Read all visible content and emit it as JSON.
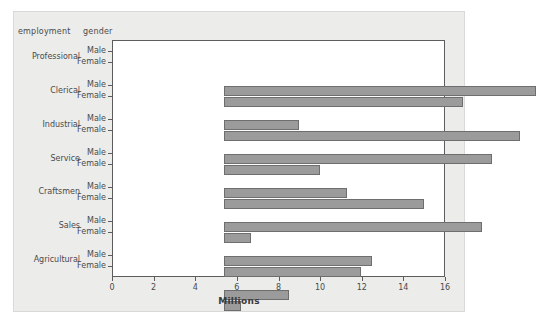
{
  "headers": {
    "employment": "employment",
    "gender": "gender"
  },
  "chart_data": {
    "type": "bar",
    "orientation": "horizontal",
    "title": "",
    "xlabel": "Millions",
    "ylabel": "",
    "xlim": [
      0,
      16
    ],
    "xticks": [
      0,
      2,
      4,
      6,
      8,
      10,
      12,
      14,
      16
    ],
    "xtick_labels": [
      "0",
      "2",
      "4",
      "6",
      "8",
      "10",
      "12",
      "14",
      "16"
    ],
    "grid": false,
    "legend": "none",
    "group_label": "employment",
    "subgroup_label": "gender",
    "categories": [
      "Professional",
      "Clerical",
      "Industrial",
      "Service",
      "Craftsmen",
      "Sales",
      "Agricultural"
    ],
    "subgroups": [
      "Male",
      "Female"
    ],
    "series": [
      {
        "name": "Male",
        "values": [
          15.0,
          3.6,
          12.9,
          5.9,
          12.4,
          7.1,
          3.1
        ]
      },
      {
        "name": "Female",
        "values": [
          11.5,
          14.2,
          4.6,
          9.6,
          1.3,
          6.6,
          0.8
        ]
      }
    ],
    "bars": [
      {
        "category": "Professional",
        "gender": "Male",
        "value": 15.0
      },
      {
        "category": "Professional",
        "gender": "Female",
        "value": 11.5
      },
      {
        "category": "Clerical",
        "gender": "Male",
        "value": 3.6
      },
      {
        "category": "Clerical",
        "gender": "Female",
        "value": 14.2
      },
      {
        "category": "Industrial",
        "gender": "Male",
        "value": 12.9
      },
      {
        "category": "Industrial",
        "gender": "Female",
        "value": 4.6
      },
      {
        "category": "Service",
        "gender": "Male",
        "value": 5.9
      },
      {
        "category": "Service",
        "gender": "Female",
        "value": 9.6
      },
      {
        "category": "Craftsmen",
        "gender": "Male",
        "value": 12.4
      },
      {
        "category": "Craftsmen",
        "gender": "Female",
        "value": 1.3
      },
      {
        "category": "Sales",
        "gender": "Male",
        "value": 7.1
      },
      {
        "category": "Sales",
        "gender": "Female",
        "value": 6.6
      },
      {
        "category": "Agricultural",
        "gender": "Male",
        "value": 3.1
      },
      {
        "category": "Agricultural",
        "gender": "Female",
        "value": 0.8
      }
    ],
    "colors": {
      "bar_fill": "#9b9b9b",
      "bar_edge": "#6e6e6e",
      "plot_background": "#ffffff",
      "figure_background": "#ececeb",
      "axis": "#5d5d5d",
      "text": "#4a4a4a"
    }
  }
}
